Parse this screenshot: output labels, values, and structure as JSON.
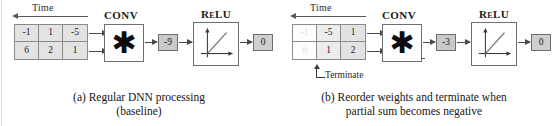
{
  "figure": {
    "panels": [
      {
        "id": "a",
        "time_label": "Time",
        "matrix": {
          "rows": [
            [
              "-1",
              "1",
              "-5"
            ],
            [
              "6",
              "2",
              "1"
            ]
          ]
        },
        "conv": {
          "title": "CONV",
          "glyph": "✱",
          "icon": "asterisk-icon"
        },
        "partial_sum": "-9",
        "relu": {
          "title": "ReLU",
          "icon": "relu-curve-icon"
        },
        "output": "0",
        "caption_lines": [
          "(a) Regular DNN processing",
          "(baseline)"
        ]
      },
      {
        "id": "b",
        "time_label": "Time",
        "matrix": {
          "rows": [
            [
              "-1",
              "-5",
              "1"
            ],
            [
              "6",
              "1",
              "2"
            ]
          ],
          "faded_column_index": 0
        },
        "terminate_label": "Terminate",
        "conv": {
          "title": "CONV",
          "glyph": "✱",
          "icon": "asterisk-icon"
        },
        "partial_sum": "-3",
        "relu": {
          "title": "ReLU",
          "icon": "relu-curve-icon"
        },
        "output": "0",
        "caption_lines": [
          "(b) Reorder weights and terminate when",
          "partial sum becomes negative"
        ]
      }
    ]
  },
  "colors": {
    "cell_fill": "#e3e3e3",
    "chip_fill": "#c9c9c9",
    "stroke": "#6f6f6f",
    "faded_text": "#dcdcdc",
    "text": "#1a1a1a"
  }
}
